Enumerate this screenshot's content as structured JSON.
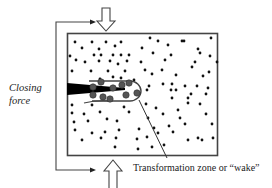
{
  "figure": {
    "labels": {
      "closing_force_line1": "Closing",
      "closing_force_line2": "force",
      "wake_label": "Transformation zone or “wake”"
    },
    "colors": {
      "outline": "#444444",
      "crack": "#000000",
      "small_particle": "#111111",
      "large_particle": "#555555",
      "background": "#ffffff"
    },
    "elements": {
      "specimen_box": "rectangular specimen",
      "crack": "black tapered crack entering from left edge",
      "wake_zone": "U-shaped transformation zone outline around crack tip",
      "top_arrow": "hollow arrow pointing down",
      "bottom_arrow": "hollow arrow pointing up",
      "closing_force_bracket": "bracket with arrows feeding into top and bottom arrows",
      "leader_line": "line from wake zone to label"
    },
    "small_particles": [
      [
        75,
        42
      ],
      [
        92,
        42
      ],
      [
        106,
        42
      ],
      [
        121,
        42
      ],
      [
        150,
        38
      ],
      [
        158,
        41
      ],
      [
        182,
        41
      ],
      [
        184,
        41
      ],
      [
        211,
        38
      ],
      [
        82,
        48
      ],
      [
        99,
        49
      ],
      [
        115,
        46
      ],
      [
        142,
        48
      ],
      [
        168,
        45
      ],
      [
        198,
        49
      ],
      [
        70,
        56
      ],
      [
        94,
        55
      ],
      [
        101,
        55
      ],
      [
        113,
        55
      ],
      [
        121,
        55
      ],
      [
        129,
        55
      ],
      [
        153,
        53
      ],
      [
        171,
        55
      ],
      [
        200,
        53
      ],
      [
        210,
        56
      ],
      [
        76,
        60
      ],
      [
        85,
        62
      ],
      [
        99,
        61
      ],
      [
        110,
        61
      ],
      [
        118,
        64
      ],
      [
        127,
        61
      ],
      [
        141,
        62
      ],
      [
        165,
        60
      ],
      [
        195,
        62
      ],
      [
        217,
        62
      ],
      [
        72,
        71
      ],
      [
        91,
        71
      ],
      [
        108,
        71
      ],
      [
        125,
        71
      ],
      [
        145,
        70
      ],
      [
        162,
        70
      ],
      [
        192,
        67
      ],
      [
        209,
        72
      ],
      [
        100,
        79
      ],
      [
        113,
        77
      ],
      [
        121,
        78
      ],
      [
        134,
        80
      ],
      [
        152,
        74
      ],
      [
        176,
        75
      ],
      [
        203,
        76
      ],
      [
        149,
        86
      ],
      [
        163,
        84
      ],
      [
        172,
        84
      ],
      [
        185,
        86
      ],
      [
        197,
        86
      ],
      [
        208,
        88
      ],
      [
        147,
        90
      ],
      [
        171,
        90
      ],
      [
        176,
        90
      ],
      [
        191,
        94
      ],
      [
        206,
        94
      ],
      [
        72,
        105
      ],
      [
        92,
        105
      ],
      [
        124,
        107
      ],
      [
        146,
        104
      ],
      [
        172,
        98
      ],
      [
        188,
        98
      ],
      [
        200,
        104
      ],
      [
        72,
        113
      ],
      [
        84,
        114
      ],
      [
        100,
        112
      ],
      [
        129,
        112
      ],
      [
        156,
        108
      ],
      [
        178,
        110
      ],
      [
        188,
        103
      ],
      [
        74,
        122
      ],
      [
        88,
        121
      ],
      [
        107,
        119
      ],
      [
        117,
        121
      ],
      [
        148,
        118
      ],
      [
        163,
        114
      ],
      [
        180,
        118
      ],
      [
        206,
        114
      ],
      [
        75,
        130
      ],
      [
        92,
        133
      ],
      [
        105,
        132
      ],
      [
        119,
        130
      ],
      [
        139,
        129
      ],
      [
        154,
        128
      ],
      [
        169,
        126
      ],
      [
        185,
        124
      ],
      [
        212,
        124
      ],
      [
        82,
        140
      ],
      [
        101,
        138
      ],
      [
        116,
        138
      ],
      [
        137,
        139
      ],
      [
        147,
        137
      ],
      [
        158,
        133
      ],
      [
        173,
        132
      ],
      [
        198,
        138
      ],
      [
        213,
        138
      ],
      [
        115,
        147
      ],
      [
        138,
        149
      ],
      [
        152,
        147
      ],
      [
        164,
        145
      ],
      [
        188,
        140
      ],
      [
        202,
        140
      ]
    ],
    "large_particles": [
      [
        93,
        87
      ],
      [
        101,
        82
      ],
      [
        113,
        88
      ],
      [
        122,
        85
      ],
      [
        129,
        83
      ],
      [
        137,
        93
      ],
      [
        103,
        97
      ],
      [
        110,
        99
      ],
      [
        126,
        95
      ],
      [
        93,
        95
      ]
    ]
  }
}
